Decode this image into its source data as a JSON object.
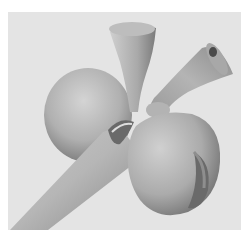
{
  "figure": {
    "caption": "~~~~~",
    "colors": {
      "background": "#e4e4e4",
      "surface_light": "#d6d6d6",
      "surface_mid": "#a8a8a8",
      "surface_dark": "#5e5e5e"
    }
  }
}
